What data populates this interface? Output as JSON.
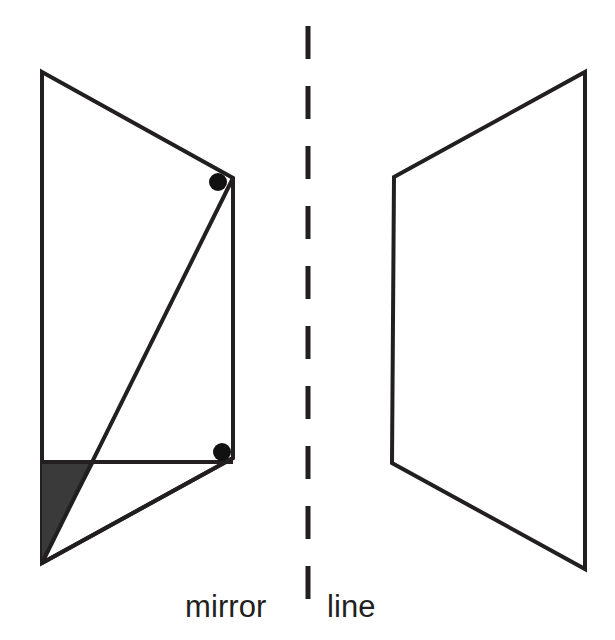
{
  "figure": {
    "background_color": "#ffffff",
    "stroke_color": "#231f20",
    "fill_color": "#3a3a3a",
    "dot_color": "#111111",
    "width": 615,
    "height": 640
  },
  "caption": {
    "mirror_label": "mirror",
    "line_label": "line",
    "full_text": "mirror | line",
    "font_size": 31,
    "color": "#231f20"
  },
  "mirror_line": {
    "name": "mirror-line",
    "orientation": "vertical",
    "x": 308,
    "y_start": 24,
    "y_end": 624,
    "style": "dashed",
    "dash_length": 33,
    "gap_length": 27,
    "stroke_width": 5,
    "color": "#231f20",
    "dash_count": 10
  },
  "left_shape": {
    "name": "left-figure",
    "description": "original quadrilateral with internal diagonal, horizontal chord and shaded corner triangle",
    "outline_points": "42,72 233,178 233,458 42,563",
    "vertices": [
      {
        "label": "top-left",
        "x": 42,
        "y": 72
      },
      {
        "label": "top-right",
        "x": 233,
        "y": 178
      },
      {
        "label": "bottom-right",
        "x": 233,
        "y": 458
      },
      {
        "label": "bottom-left",
        "x": 42,
        "y": 563
      }
    ],
    "diagonal": {
      "x1": 233,
      "y1": 178,
      "x2": 42,
      "y2": 563
    },
    "chord": {
      "x1": 42,
      "y1": 462,
      "x2": 233,
      "y2": 462
    },
    "lower_edge": {
      "x1": 233,
      "y1": 458,
      "x2": 42,
      "y2": 563
    },
    "left_edge": {
      "x1": 42,
      "y1": 72,
      "x2": 42,
      "y2": 563
    },
    "right_edge": {
      "x1": 233,
      "y1": 178,
      "x2": 233,
      "y2": 458
    },
    "top_edge": {
      "x1": 42,
      "y1": 72,
      "x2": 233,
      "y2": 178
    },
    "shaded_triangle": {
      "points": "42,460 96,460 42,563",
      "fill": "#3a3a3a"
    },
    "dots": [
      {
        "name": "upper-vertex-dot",
        "cx": 218,
        "cy": 182,
        "r": 9
      },
      {
        "name": "lower-vertex-dot",
        "cx": 222,
        "cy": 452,
        "r": 9
      }
    ]
  },
  "right_shape": {
    "name": "right-figure",
    "description": "reflected blank quadrilateral on the other side of the mirror line",
    "outline_points": "394,177 585,72 585,569 392,463",
    "vertices": [
      {
        "label": "top-left",
        "x": 394,
        "y": 177
      },
      {
        "label": "top-right",
        "x": 585,
        "y": 72
      },
      {
        "label": "bottom-right",
        "x": 585,
        "y": 569
      },
      {
        "label": "bottom-left",
        "x": 392,
        "y": 463
      }
    ]
  },
  "stroke_width": 4
}
